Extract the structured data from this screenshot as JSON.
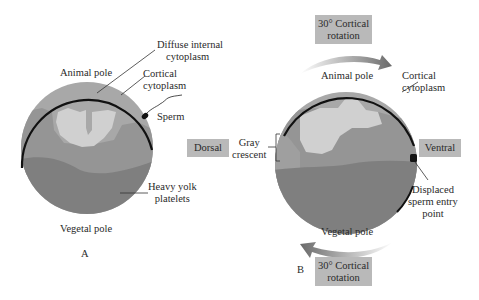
{
  "colors": {
    "background": "#ffffff",
    "diffuse_internal": "#a8a8a8",
    "cortical": "#959595",
    "light_region": "#cfcfcf",
    "yolk": "#7d7d7d",
    "outline": "#111111",
    "label_box": "#b9b9b9",
    "arrow": "#6a6a6a"
  },
  "panel_a": {
    "letter": "A",
    "labels": {
      "diffuse_internal_line1": "Diffuse internal",
      "diffuse_internal_line2": "cytoplasm",
      "animal_pole": "Animal pole",
      "cortical_line1": "Cortical",
      "cortical_line2": "cytoplasm",
      "sperm": "Sperm",
      "yolk_line1": "Heavy yolk",
      "yolk_line2": "platelets",
      "vegetal_pole": "Vegetal pole"
    }
  },
  "panel_b": {
    "letter": "B",
    "top_rotation_line1": "30° Cortical",
    "top_rotation_line2": "rotation",
    "bottom_rotation_line1": "30° Cortical",
    "bottom_rotation_line2": "rotation",
    "labels": {
      "animal_pole": "Animal pole",
      "cortical_line1": "Cortical",
      "cortical_line2": "cytoplasm",
      "dorsal": "Dorsal",
      "gray_crescent_line1": "Gray",
      "gray_crescent_line2": "crescent",
      "ventral": "Ventral",
      "sperm_entry_line1": "Displaced",
      "sperm_entry_line2": "sperm entry",
      "sperm_entry_line3": "point",
      "vegetal_pole": "Vegetal pole"
    }
  }
}
